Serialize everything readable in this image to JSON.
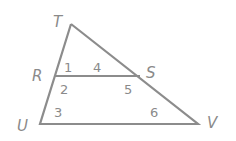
{
  "diagram": {
    "type": "triangle-with-parallel-segment",
    "stroke_color": "#8c8c8c",
    "label_color": "#8a8a8a",
    "vertices": {
      "T": {
        "label": "T",
        "x": 71,
        "y": 24
      },
      "R": {
        "label": "R",
        "x": 55,
        "y": 76
      },
      "U": {
        "label": "U",
        "x": 40,
        "y": 124
      },
      "S": {
        "label": "S",
        "x": 140,
        "y": 76
      },
      "V": {
        "label": "V",
        "x": 198,
        "y": 124
      }
    },
    "segments": [
      "TU",
      "TV",
      "UV",
      "RS"
    ],
    "angles": [
      {
        "label": "1",
        "at": "R"
      },
      {
        "label": "4",
        "at": "S"
      },
      {
        "label": "2",
        "at": "R"
      },
      {
        "label": "3",
        "at": "U"
      },
      {
        "label": "5",
        "at": "S"
      },
      {
        "label": "6",
        "at": "V"
      }
    ]
  }
}
